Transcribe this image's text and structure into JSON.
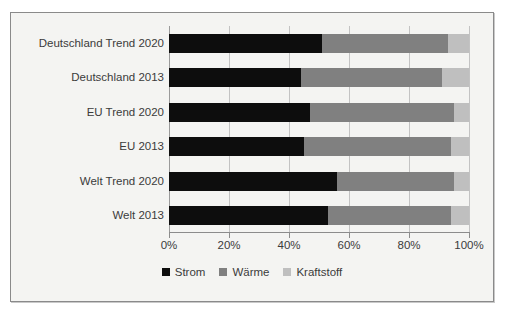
{
  "chart_data": {
    "type": "bar",
    "orientation": "horizontal",
    "stacked": true,
    "stack_total": 100,
    "title": "",
    "xlabel": "",
    "ylabel": "",
    "xlim": [
      0,
      100
    ],
    "grid": true,
    "legend_position": "bottom",
    "xticks": [
      0,
      20,
      40,
      60,
      80,
      100
    ],
    "xtick_labels": [
      "0%",
      "20%",
      "40%",
      "60%",
      "80%",
      "100%"
    ],
    "categories": [
      "Deutschland Trend 2020",
      "Deutschland 2013",
      "EU Trend 2020",
      "EU 2013",
      "Welt Trend 2020",
      "Welt 2013"
    ],
    "series": [
      {
        "name": "Strom",
        "color": "#0d0d0d",
        "values": [
          51,
          44,
          47,
          45,
          56,
          53
        ]
      },
      {
        "name": "Wärme",
        "color": "#808080",
        "values": [
          42,
          47,
          48,
          49,
          39,
          41
        ]
      },
      {
        "name": "Kraftstoff",
        "color": "#bfbfbf",
        "values": [
          7,
          9,
          5,
          6,
          5,
          6
        ]
      }
    ]
  },
  "legend": {
    "items": [
      {
        "label": "Strom",
        "color": "#0d0d0d"
      },
      {
        "label": "Wärme",
        "color": "#808080"
      },
      {
        "label": "Kraftstoff",
        "color": "#bfbfbf"
      }
    ]
  },
  "colors": {
    "frame_border": "#8a8a8a",
    "plot_background": "#f4f4f2",
    "gridline": "#c3c3c3",
    "axis": "#8c8c8c",
    "text": "#3b3b3b"
  }
}
